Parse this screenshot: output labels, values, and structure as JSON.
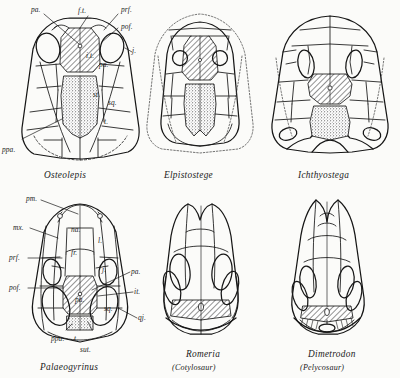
{
  "figure": {
    "type": "comparative-anatomy-plate",
    "background_color": "#fbfbf9",
    "ink_color": "#161616",
    "fills": {
      "hatched_label": "parietals (pa.)",
      "hatched_pattern": "diagonal-line-hatching",
      "stippled_label": "post-parietals (ppa.)",
      "stippled_pattern": "stipple-dots"
    }
  },
  "specimens": [
    {
      "id": "osteolepis",
      "name": "Osteolepis",
      "subtitle": "",
      "row": "top",
      "column": "left",
      "labels": [
        "pa.",
        "f.t.",
        "prf.",
        "pof.",
        "i.t.",
        "pa.",
        "j.",
        "st.",
        "sq.",
        "t.",
        "ppa."
      ]
    },
    {
      "id": "elpistostege",
      "name": "Elpistostege",
      "subtitle": "",
      "row": "top",
      "column": "center",
      "labels": []
    },
    {
      "id": "ichthyostega",
      "name": "Ichthyostega",
      "subtitle": "",
      "row": "top",
      "column": "right",
      "labels": []
    },
    {
      "id": "palaeogyrinus",
      "name": "Palaeogyrinus",
      "subtitle": "",
      "row": "bottom",
      "column": "left",
      "labels": [
        "pm.",
        "mx.",
        "na.",
        "l.",
        "prf.",
        "fr.",
        "pof.",
        "j.",
        "pa.",
        "it.",
        "pa.",
        "sq.",
        "qj.",
        "ppa.",
        "t.",
        "sut."
      ]
    },
    {
      "id": "romeria",
      "name": "Romeria",
      "subtitle": "(Cotylosaur)",
      "row": "bottom",
      "column": "center",
      "labels": []
    },
    {
      "id": "dimetrodon",
      "name": "Dimetrodon",
      "subtitle": "(Pelycosaur)",
      "row": "bottom",
      "column": "right",
      "labels": []
    }
  ],
  "osteolepis_labels": {
    "pa_top": "pa.",
    "ft": "f.t.",
    "prf": "prf.",
    "pof": "pof.",
    "it": "i.t.",
    "pa_mid": "pa.",
    "j": "j.",
    "st": "st.",
    "sq": "sq.",
    "t": "t.",
    "ppa": "ppa."
  },
  "palaeogyrinus_labels": {
    "pm": "pm.",
    "mx": "mx.",
    "na": "na.",
    "l": "l.",
    "prf": "prf.",
    "fr": "fr.",
    "pof": "pof.",
    "j": "j.",
    "pa_right": "pa.",
    "it": "it.",
    "pa_center": "pa.",
    "sq": "sq.",
    "qj": "qj.",
    "ppa": "ppa.",
    "t": "t.",
    "sut": "sut."
  }
}
